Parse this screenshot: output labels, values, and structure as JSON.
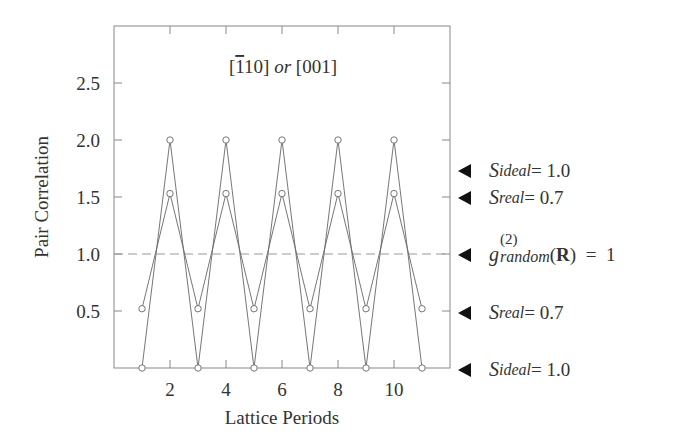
{
  "chart_data": {
    "type": "line",
    "title_parts": {
      "dir1_bar": "1",
      "dir1_rest": "10",
      "or": "or",
      "dir2": "[001]"
    },
    "xlabel": "Lattice Periods",
    "ylabel": "Pair Correlation",
    "xlim": [
      0,
      12
    ],
    "ylim": [
      0,
      3.0
    ],
    "xticks": [
      2,
      4,
      6,
      8,
      10
    ],
    "xtick_labels": [
      "2",
      "4",
      "6",
      "8",
      "10"
    ],
    "yticks": [
      0.5,
      1.0,
      1.5,
      2.0,
      2.5
    ],
    "ytick_labels": [
      "0.5",
      "1.0",
      "1.5",
      "2.0",
      "2.5"
    ],
    "grid": false,
    "x": [
      1,
      2,
      3,
      4,
      5,
      6,
      7,
      8,
      9,
      10,
      11
    ],
    "series": [
      {
        "name": "S_ideal = 1.0",
        "marker": "open-circle",
        "values": [
          0,
          2.0,
          0,
          2.0,
          0,
          2.0,
          0,
          2.0,
          0,
          2.0,
          0
        ]
      },
      {
        "name": "S_real = 0.7",
        "marker": "open-circle",
        "values": [
          0.52,
          1.53,
          0.52,
          1.53,
          0.52,
          1.53,
          0.52,
          1.53,
          0.52,
          1.53,
          0.52
        ]
      }
    ],
    "reference_line": {
      "name": "g(2)_random(R) = 1",
      "y": 1.0,
      "style": "dashed"
    },
    "annotations": [
      {
        "y": 2.0,
        "label": "S_ideal = 1.0"
      },
      {
        "y": 1.53,
        "label": "S_real = 0.7"
      },
      {
        "y": 1.0,
        "label": "g(2)_random(R) = 1"
      },
      {
        "y": 0.52,
        "label": "S_real = 0.7"
      },
      {
        "y": 0.0,
        "label": "S_ideal = 1.0"
      }
    ]
  },
  "annotations_text": {
    "ideal_top": {
      "S": "S",
      "sub": "ideal",
      "rest": " = 1.0"
    },
    "real_top": {
      "S": "S",
      "sub": "real",
      "rest": " = 0.7"
    },
    "random": {
      "g": "g",
      "sup": "(2)",
      "sub": "random",
      "open": "(",
      "R": "R",
      "close": ")",
      "rest": "  =  1"
    },
    "real_bottom": {
      "S": "S",
      "sub": "real",
      "rest": " = 0.7"
    },
    "ideal_bottom": {
      "S": "S",
      "sub": "ideal",
      "rest": " = 1.0"
    }
  }
}
